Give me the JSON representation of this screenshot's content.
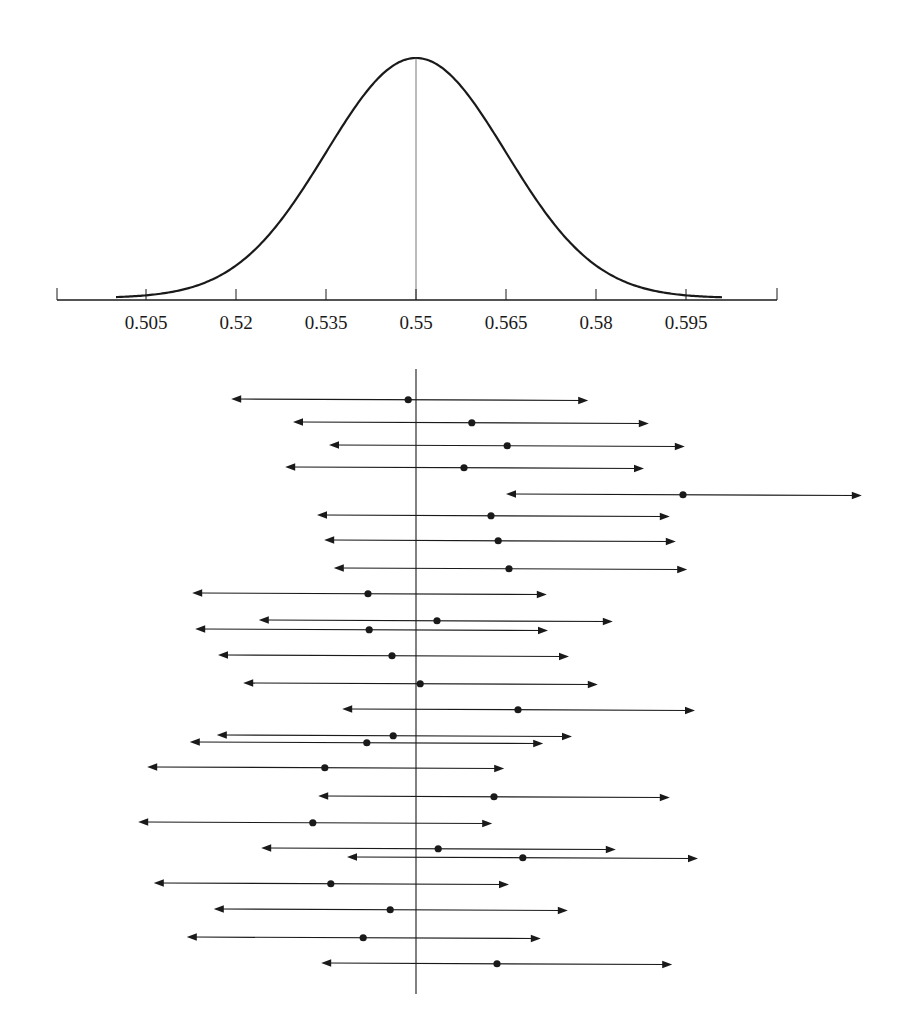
{
  "chart_data": {
    "type": "interval",
    "title": "",
    "distribution": {
      "type": "normal",
      "mean": 0.55,
      "sd": 0.015,
      "curve_range": [
        0.5,
        0.601
      ]
    },
    "x_axis": {
      "ticks": [
        0.505,
        0.52,
        0.535,
        0.55,
        0.565,
        0.58,
        0.595
      ],
      "tick_labels": [
        "0.505",
        "0.52",
        "0.535",
        "0.55",
        "0.565",
        "0.58",
        "0.595"
      ],
      "range": [
        0.49,
        0.61
      ],
      "xlabel": ""
    },
    "reference_line": 0.55,
    "intervals": [
      {
        "estimate": 0.5487,
        "lower": 0.5192,
        "upper": 0.5787
      },
      {
        "estimate": 0.5593,
        "lower": 0.5295,
        "upper": 0.5888
      },
      {
        "estimate": 0.5652,
        "lower": 0.5355,
        "upper": 0.5948
      },
      {
        "estimate": 0.558,
        "lower": 0.5282,
        "upper": 0.588
      },
      {
        "estimate": 0.5945,
        "lower": 0.565,
        "upper": 0.6243
      },
      {
        "estimate": 0.5625,
        "lower": 0.5335,
        "upper": 0.5923
      },
      {
        "estimate": 0.5637,
        "lower": 0.5347,
        "upper": 0.5933
      },
      {
        "estimate": 0.5655,
        "lower": 0.5363,
        "upper": 0.5952
      },
      {
        "estimate": 0.542,
        "lower": 0.5127,
        "upper": 0.5718
      },
      {
        "estimate": 0.5535,
        "lower": 0.5238,
        "upper": 0.5828
      },
      {
        "estimate": 0.5422,
        "lower": 0.5132,
        "upper": 0.572
      },
      {
        "estimate": 0.546,
        "lower": 0.517,
        "upper": 0.5755
      },
      {
        "estimate": 0.5507,
        "lower": 0.5212,
        "upper": 0.5803
      },
      {
        "estimate": 0.567,
        "lower": 0.5377,
        "upper": 0.5965
      },
      {
        "estimate": 0.5462,
        "lower": 0.5168,
        "upper": 0.576
      },
      {
        "estimate": 0.5418,
        "lower": 0.5123,
        "upper": 0.5712
      },
      {
        "estimate": 0.5348,
        "lower": 0.5052,
        "upper": 0.5647
      },
      {
        "estimate": 0.563,
        "lower": 0.5337,
        "upper": 0.5923
      },
      {
        "estimate": 0.5328,
        "lower": 0.5037,
        "upper": 0.5627
      },
      {
        "estimate": 0.5537,
        "lower": 0.5242,
        "upper": 0.5833
      },
      {
        "estimate": 0.5678,
        "lower": 0.5385,
        "upper": 0.597
      },
      {
        "estimate": 0.5358,
        "lower": 0.5063,
        "upper": 0.5655
      },
      {
        "estimate": 0.5457,
        "lower": 0.5163,
        "upper": 0.5753
      },
      {
        "estimate": 0.5412,
        "lower": 0.5118,
        "upper": 0.5708
      },
      {
        "estimate": 0.5635,
        "lower": 0.5342,
        "upper": 0.5927
      }
    ],
    "interval_rows_y": [
      399,
      422,
      445,
      467,
      494,
      515,
      540,
      568,
      593,
      620,
      629,
      655,
      683,
      709,
      735,
      742,
      767,
      796,
      822,
      848,
      857,
      883,
      909,
      937,
      963
    ],
    "grid": false,
    "legend": null
  },
  "layout": {
    "px_per_unit": 6000,
    "center_value": 0.55,
    "center_x": 416,
    "axis_y": 300,
    "axis_x_start": 57,
    "axis_x_end": 777,
    "curve_peak_y": 58,
    "ref_line_top": 369,
    "ref_line_bottom": 994,
    "line_color": "#1a1a1a"
  }
}
